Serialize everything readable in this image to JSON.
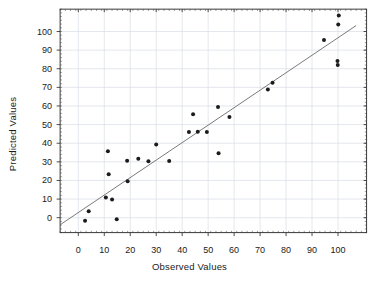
{
  "chart_data": {
    "type": "scatter",
    "title": "",
    "xlabel": "Observed Values",
    "ylabel": "Predicted Values",
    "xlim": [
      -7,
      111
    ],
    "ylim": [
      -8,
      112
    ],
    "xticks": [
      0,
      10,
      20,
      30,
      40,
      50,
      60,
      70,
      80,
      90,
      100
    ],
    "yticks": [
      0,
      10,
      20,
      30,
      40,
      50,
      60,
      70,
      80,
      90,
      100
    ],
    "xtick_labels": [
      "0",
      "10",
      "20",
      "30",
      "40",
      "50",
      "60",
      "70",
      "80",
      "90",
      "100"
    ],
    "ytick_labels": [
      "0",
      "10",
      "20",
      "30",
      "40",
      "50",
      "60",
      "70",
      "80",
      "90",
      "100"
    ],
    "grid": true,
    "grid_color": "#d8dde4",
    "frame_color": "#3a3a3a",
    "marker_color": "#1b1b1b",
    "marker_size": 3.2,
    "legend": null,
    "series": [
      {
        "name": "Observed vs Predicted",
        "type": "scatter",
        "points": [
          [
            2.6,
            -1.7
          ],
          [
            4.0,
            3.5
          ],
          [
            10.6,
            10.9
          ],
          [
            11.4,
            35.7
          ],
          [
            11.7,
            23.3
          ],
          [
            13.0,
            9.8
          ],
          [
            14.8,
            -0.8
          ],
          [
            18.8,
            30.6
          ],
          [
            19.0,
            19.6
          ],
          [
            23.1,
            31.7
          ],
          [
            27.0,
            30.3
          ],
          [
            30.0,
            39.3
          ],
          [
            35.0,
            30.5
          ],
          [
            42.6,
            46.0
          ],
          [
            44.2,
            55.6
          ],
          [
            46.0,
            46.2
          ],
          [
            49.5,
            46.0
          ],
          [
            53.8,
            59.4
          ],
          [
            54.0,
            34.6
          ],
          [
            58.2,
            54.1
          ],
          [
            73.0,
            68.9
          ],
          [
            74.8,
            72.5
          ],
          [
            94.6,
            95.4
          ],
          [
            99.8,
            84.2
          ],
          [
            99.9,
            82.0
          ],
          [
            100.1,
            103.8
          ],
          [
            100.3,
            108.6
          ]
        ]
      },
      {
        "name": "regression-line",
        "type": "line",
        "color": "#6b6b6b",
        "width": 0.9,
        "endpoints": [
          [
            -7,
            -3.8
          ],
          [
            107,
            103.2
          ]
        ]
      }
    ]
  },
  "axes": {
    "x_title": "Observed Values",
    "y_title": "Predicted Values"
  }
}
